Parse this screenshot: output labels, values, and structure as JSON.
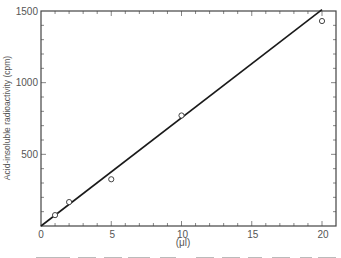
{
  "chart_data": {
    "type": "scatter",
    "title": "",
    "xlabel": "(μl)",
    "ylabel": "Acid-insoluble radioactivity (cpm)",
    "xlim": [
      0,
      20.5
    ],
    "ylim": [
      0,
      1500
    ],
    "x_ticks": [
      0,
      5,
      10,
      15,
      20
    ],
    "x_tick_labels": [
      "0",
      "5",
      "10",
      "15",
      "20"
    ],
    "y_ticks": [
      500,
      1000,
      1500
    ],
    "y_tick_labels": [
      "500",
      "1000",
      "1500"
    ],
    "x_minor_step": 1,
    "y_minor_step": 100,
    "grid": false,
    "legend": null,
    "series": [
      {
        "name": "measured",
        "marker": "open-circle",
        "x": [
          1,
          2,
          5,
          10,
          20
        ],
        "y": [
          76,
          167,
          326,
          771,
          1430
        ]
      }
    ],
    "fit_line": {
      "name": "linear fit",
      "x": [
        0,
        20
      ],
      "y": [
        0,
        1510
      ]
    }
  },
  "labels": {
    "origin": "0",
    "ylabel": "Acid-insoluble radioactivity (cpm)",
    "xlabel": "(μl)"
  },
  "colors": {
    "line": "#1a1a1a",
    "frame": "#444444",
    "text": "#555555"
  }
}
